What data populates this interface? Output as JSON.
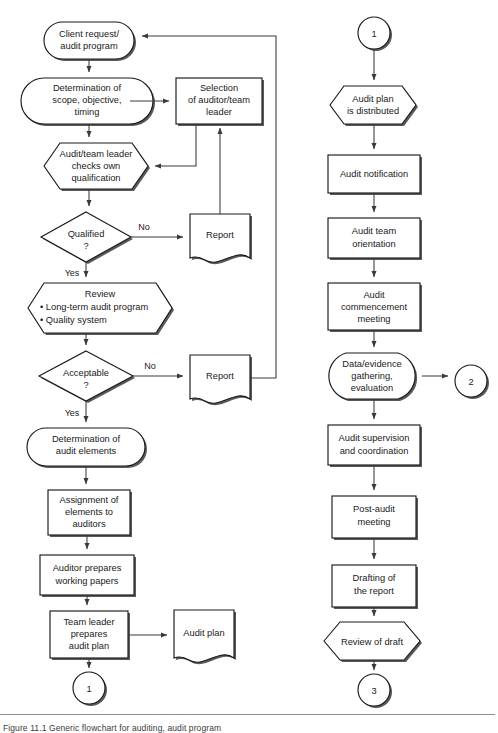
{
  "figure": {
    "caption": "Figure 11.1  Generic flowchart for auditing, audit program"
  },
  "left_column": {
    "nodes": [
      {
        "id": "client-request",
        "shape": "stadium",
        "lines": [
          "Client request/",
          "audit program"
        ]
      },
      {
        "id": "determination-scope",
        "shape": "process",
        "lines": [
          "Determination of",
          "scope, objective,",
          "timing"
        ]
      },
      {
        "id": "selection-auditor",
        "shape": "rect",
        "lines": [
          "Selection",
          "of auditor/team",
          "leader"
        ]
      },
      {
        "id": "checks-qualification",
        "shape": "hexagon",
        "lines": [
          "Audit/team leader",
          "checks own",
          "qualification"
        ]
      },
      {
        "id": "qualified-decision",
        "shape": "diamond",
        "lines": [
          "Qualified",
          "?"
        ]
      },
      {
        "id": "report-1",
        "shape": "document",
        "lines": [
          "Report"
        ]
      },
      {
        "id": "review",
        "shape": "hexagon",
        "lines": [
          "Review",
          "• Long-term audit program",
          "• Quality system"
        ]
      },
      {
        "id": "acceptable-decision",
        "shape": "diamond",
        "lines": [
          "Acceptable",
          "?"
        ]
      },
      {
        "id": "report-2",
        "shape": "document",
        "lines": [
          "Report"
        ]
      },
      {
        "id": "determination-elements",
        "shape": "stadium",
        "lines": [
          "Determination of",
          "audit elements"
        ]
      },
      {
        "id": "assignment-elements",
        "shape": "rect",
        "lines": [
          "Assignment of",
          "elements to",
          "auditors"
        ]
      },
      {
        "id": "auditor-prepares",
        "shape": "rect",
        "lines": [
          "Auditor prepares",
          "working papers"
        ]
      },
      {
        "id": "team-leader-prepares",
        "shape": "rect",
        "lines": [
          "Team leader",
          "prepares",
          "audit plan"
        ]
      },
      {
        "id": "audit-plan-doc",
        "shape": "document",
        "lines": [
          "Audit plan"
        ]
      },
      {
        "id": "connector-1-out",
        "shape": "circle",
        "lines": [
          "1"
        ]
      }
    ],
    "edge_labels": {
      "qualified_no": "No",
      "qualified_yes": "Yes",
      "acceptable_no": "No",
      "acceptable_yes": "Yes"
    }
  },
  "right_column": {
    "nodes": [
      {
        "id": "connector-1-in",
        "shape": "circle",
        "lines": [
          "1"
        ]
      },
      {
        "id": "plan-distributed",
        "shape": "hexagon",
        "lines": [
          "Audit plan",
          "is distributed"
        ]
      },
      {
        "id": "audit-notification",
        "shape": "rect",
        "lines": [
          "Audit notification"
        ]
      },
      {
        "id": "audit-team-orientation",
        "shape": "rect",
        "lines": [
          "Audit team",
          "orientation"
        ]
      },
      {
        "id": "commencement-meeting",
        "shape": "rect",
        "lines": [
          "Audit",
          "commencement",
          "meeting"
        ]
      },
      {
        "id": "data-evidence",
        "shape": "stadium",
        "lines": [
          "Data/evidence",
          "gathering,",
          "evaluation"
        ]
      },
      {
        "id": "connector-2",
        "shape": "circle",
        "lines": [
          "2"
        ]
      },
      {
        "id": "audit-supervision",
        "shape": "rect",
        "lines": [
          "Audit supervision",
          "and coordination"
        ]
      },
      {
        "id": "post-audit-meeting",
        "shape": "rect",
        "lines": [
          "Post-audit",
          "meeting"
        ]
      },
      {
        "id": "drafting-report",
        "shape": "rect",
        "lines": [
          "Drafting of",
          "the report"
        ]
      },
      {
        "id": "review-of-draft",
        "shape": "hexagon",
        "lines": [
          "Review of draft"
        ]
      },
      {
        "id": "connector-3",
        "shape": "circle",
        "lines": [
          "3"
        ]
      }
    ]
  },
  "colors": {
    "stroke": "#1a1a1a",
    "line": "#3a3a3a",
    "shadow": "#5a5a5a",
    "background": "#ffffff"
  }
}
